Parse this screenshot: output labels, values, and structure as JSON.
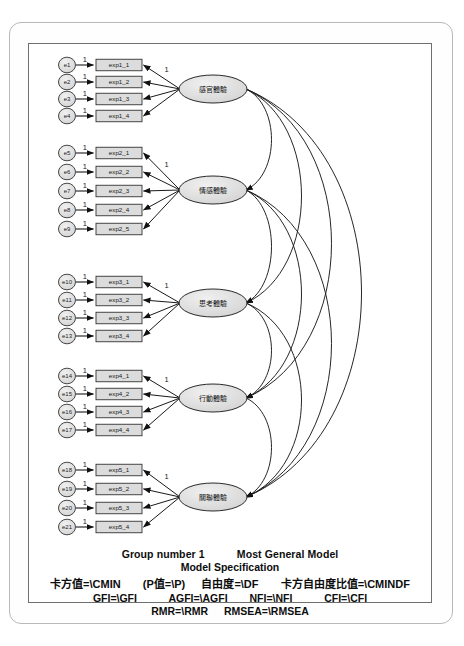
{
  "diagram": {
    "type": "sem-path-diagram",
    "title_hidden": "",
    "latent_factors": [
      {
        "id": "F1",
        "label": "感官體驗",
        "cx": 213,
        "cy": 89,
        "rx": 34,
        "ry": 14
      },
      {
        "id": "F2",
        "label": "情感體驗",
        "cx": 213,
        "cy": 190,
        "rx": 34,
        "ry": 14
      },
      {
        "id": "F3",
        "label": "思考體驗",
        "cx": 213,
        "cy": 303,
        "rx": 34,
        "ry": 14
      },
      {
        "id": "F4",
        "label": "行動體驗",
        "cx": 213,
        "cy": 398,
        "rx": 34,
        "ry": 14
      },
      {
        "id": "F5",
        "label": "關聯體驗",
        "cx": 213,
        "cy": 497,
        "rx": 34,
        "ry": 14
      }
    ],
    "groups": [
      {
        "factor": "F1",
        "fixed_loading": "1",
        "indicators": [
          {
            "error": "e1",
            "box": "exp1_1",
            "y": 65
          },
          {
            "error": "e2",
            "box": "exp1_2",
            "y": 82
          },
          {
            "error": "e3",
            "box": "exp1_3",
            "y": 99
          },
          {
            "error": "e4",
            "box": "exp1_4",
            "y": 116
          }
        ]
      },
      {
        "factor": "F2",
        "fixed_loading": "1",
        "indicators": [
          {
            "error": "e5",
            "box": "exp2_1",
            "y": 153
          },
          {
            "error": "e6",
            "box": "exp2_2",
            "y": 172
          },
          {
            "error": "e7",
            "box": "exp2_3",
            "y": 191
          },
          {
            "error": "e8",
            "box": "exp2_4",
            "y": 210
          },
          {
            "error": "e9",
            "box": "exp2_5",
            "y": 229
          }
        ]
      },
      {
        "factor": "F3",
        "fixed_loading": "1",
        "indicators": [
          {
            "error": "e10",
            "box": "exp3_1",
            "y": 282
          },
          {
            "error": "e11",
            "box": "exp3_2",
            "y": 300
          },
          {
            "error": "e12",
            "box": "exp3_3",
            "y": 318
          },
          {
            "error": "e13",
            "box": "exp3_4",
            "y": 336
          }
        ]
      },
      {
        "factor": "F4",
        "fixed_loading": "1",
        "indicators": [
          {
            "error": "e14",
            "box": "exp4_1",
            "y": 376
          },
          {
            "error": "e15",
            "box": "exp4_2",
            "y": 394
          },
          {
            "error": "e16",
            "box": "exp4_3",
            "y": 412
          },
          {
            "error": "e17",
            "box": "exp4_4",
            "y": 430
          }
        ]
      },
      {
        "factor": "F5",
        "fixed_loading": "1",
        "indicators": [
          {
            "error": "e18",
            "box": "exp5_1",
            "y": 470
          },
          {
            "error": "e19",
            "box": "exp5_2",
            "y": 489
          },
          {
            "error": "e20",
            "box": "exp5_3",
            "y": 508
          },
          {
            "error": "e21",
            "box": "exp5_4",
            "y": 527
          }
        ]
      }
    ],
    "covariances": [
      {
        "from": "F1",
        "to": "F2"
      },
      {
        "from": "F1",
        "to": "F3"
      },
      {
        "from": "F1",
        "to": "F4"
      },
      {
        "from": "F1",
        "to": "F5"
      },
      {
        "from": "F2",
        "to": "F3"
      },
      {
        "from": "F2",
        "to": "F4"
      },
      {
        "from": "F2",
        "to": "F5"
      },
      {
        "from": "F3",
        "to": "F4"
      },
      {
        "from": "F3",
        "to": "F5"
      },
      {
        "from": "F4",
        "to": "F5"
      }
    ],
    "colors": {
      "node_fill": "#d9d9d9",
      "node_stroke": "#333333",
      "line": "#1a1a1a",
      "frame": "#b9b9b9",
      "canvas_border": "#6f6f6f",
      "text": "#0d0d0d"
    }
  },
  "footer": {
    "group_number": "Group number 1",
    "model_name": "Most General Model",
    "model_specification": "Model Specification",
    "fit_line_1": {
      "chi_square": "卡方值=\\CMIN",
      "p_value": "(P值=\\P)",
      "df": "自由度=\\DF",
      "chi_df_ratio": "卡方自由度比值=\\CMINDF"
    },
    "fit_line_2": {
      "gfi": "GFI=\\GFI",
      "agfi": "AGFI=\\AGFI",
      "nfi": "NFI=\\NFI",
      "cfi": "CFI=\\CFI"
    },
    "fit_line_3": {
      "rmr": "RMR=\\RMR",
      "rmsea": "RMSEA=\\RMSEA"
    }
  }
}
